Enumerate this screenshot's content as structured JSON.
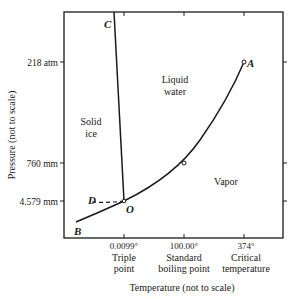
{
  "diagram": {
    "y_axis": {
      "label": "Pressure (not to scale)",
      "ticks": [
        {
          "label": "218 atm",
          "y": 62
        },
        {
          "label": "760 mm",
          "y": 163
        },
        {
          "label": "4.579 mm",
          "y": 201
        }
      ]
    },
    "x_axis": {
      "label": "Temperature (not to scale)",
      "ticks": [
        {
          "value": "0.0099°",
          "caption1": "Triple",
          "caption2": "point",
          "x": 124
        },
        {
          "value": "100.00°",
          "caption1": "Standard",
          "caption2": "boiling point",
          "x": 184
        },
        {
          "value": "374°",
          "caption1": "Critical",
          "caption2": "temperature",
          "x": 244
        }
      ]
    },
    "regions": {
      "solid_line1": "Solid",
      "solid_line2": "ice",
      "liquid_line1": "Liquid",
      "liquid_line2": "water",
      "vapor": "Vapor"
    },
    "points": {
      "A": "A",
      "B": "B",
      "C": "C",
      "D": "D",
      "O": "O"
    },
    "curves": [
      {
        "name": "OA",
        "description": "liquid-vapor boundary (vaporization curve)"
      },
      {
        "name": "OB",
        "description": "solid-vapor boundary (sublimation curve)"
      },
      {
        "name": "OC",
        "description": "solid-liquid boundary (melting curve)"
      },
      {
        "name": "OD",
        "description": "supercooled liquid (dashed)"
      }
    ]
  }
}
